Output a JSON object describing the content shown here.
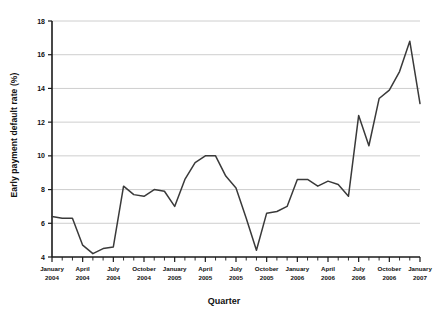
{
  "chart_data": {
    "type": "line",
    "title": "",
    "xlabel": "Quarter",
    "ylabel": "Early payment default rate (%)",
    "ylim": [
      4,
      18
    ],
    "yticks": [
      4,
      6,
      8,
      10,
      12,
      14,
      16,
      18
    ],
    "grid": true,
    "legend": "none",
    "x_tick_labels": [
      {
        "line1": "January",
        "line2": "2004"
      },
      {
        "line1": "April",
        "line2": "2004"
      },
      {
        "line1": "July",
        "line2": "2004"
      },
      {
        "line1": "October",
        "line2": "2004"
      },
      {
        "line1": "January",
        "line2": "2005"
      },
      {
        "line1": "April",
        "line2": "2005"
      },
      {
        "line1": "July",
        "line2": "2005"
      },
      {
        "line1": "October",
        "line2": "2005"
      },
      {
        "line1": "January",
        "line2": "2006"
      },
      {
        "line1": "April",
        "line2": "2006"
      },
      {
        "line1": "July",
        "line2": "2006"
      },
      {
        "line1": "October",
        "line2": "2006"
      },
      {
        "line1": "January",
        "line2": "2007"
      }
    ],
    "x": [
      "2004-01",
      "2004-02",
      "2004-03",
      "2004-04",
      "2004-05",
      "2004-06",
      "2004-07",
      "2004-08",
      "2004-09",
      "2004-10",
      "2004-11",
      "2004-12",
      "2005-01",
      "2005-02",
      "2005-03",
      "2005-04",
      "2005-05",
      "2005-06",
      "2005-07",
      "2005-08",
      "2005-09",
      "2005-10",
      "2005-11",
      "2005-12",
      "2006-01",
      "2006-02",
      "2006-03",
      "2006-04",
      "2006-05",
      "2006-06",
      "2006-07",
      "2006-08",
      "2006-09",
      "2006-10",
      "2006-11",
      "2006-12",
      "2007-01"
    ],
    "values": [
      6.4,
      6.3,
      6.3,
      4.7,
      4.2,
      4.5,
      4.6,
      8.2,
      7.7,
      7.6,
      8.0,
      7.9,
      7.0,
      8.6,
      9.6,
      10.0,
      10.0,
      8.8,
      8.1,
      6.3,
      4.4,
      6.6,
      6.7,
      7.0,
      8.6,
      8.6,
      8.2,
      8.5,
      8.3,
      7.6,
      12.4,
      10.6,
      13.4,
      13.9,
      15.0,
      16.8,
      13.1
    ],
    "line_color": "#3a3a3a",
    "grid_color": "#c8c8c8",
    "axis_color": "#1a1a1a"
  }
}
